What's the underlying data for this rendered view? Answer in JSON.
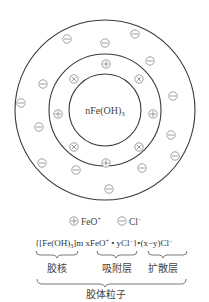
{
  "diagram": {
    "core": {
      "label": "nFe(OH)",
      "subscript": "3"
    },
    "rings": [
      {
        "name": "outer-diffuse-ring",
        "cx": 105,
        "cy": 110,
        "r": 90
      },
      {
        "name": "middle-adsorption-ring",
        "cx": 105,
        "cy": 110,
        "r": 56
      },
      {
        "name": "inner-core-ring",
        "cx": 105,
        "cy": 110,
        "r": 36
      }
    ],
    "ions": [
      {
        "type": "plus",
        "x": 106,
        "y": 64
      },
      {
        "type": "plus",
        "x": 58,
        "y": 114
      },
      {
        "type": "plus",
        "x": 153,
        "y": 114
      },
      {
        "type": "plus",
        "x": 106,
        "y": 163
      },
      {
        "type": "cross",
        "x": 74,
        "y": 79
      },
      {
        "type": "cross",
        "x": 139,
        "y": 79
      },
      {
        "type": "cross",
        "x": 74,
        "y": 147
      },
      {
        "type": "cross",
        "x": 139,
        "y": 147
      },
      {
        "type": "minus",
        "x": 67,
        "y": 39
      },
      {
        "type": "minus",
        "x": 105,
        "y": 43
      },
      {
        "type": "minus",
        "x": 135,
        "y": 34
      },
      {
        "type": "minus",
        "x": 150,
        "y": 61
      },
      {
        "type": "minus",
        "x": 43,
        "y": 84
      },
      {
        "type": "minus",
        "x": 173,
        "y": 96
      },
      {
        "type": "minus",
        "x": 21,
        "y": 103
      },
      {
        "type": "minus",
        "x": 39,
        "y": 127
      },
      {
        "type": "minus",
        "x": 171,
        "y": 135
      },
      {
        "type": "minus",
        "x": 175,
        "y": 156
      },
      {
        "type": "minus",
        "x": 42,
        "y": 163
      },
      {
        "type": "minus",
        "x": 76,
        "y": 170
      },
      {
        "type": "minus",
        "x": 142,
        "y": 168
      },
      {
        "type": "minus",
        "x": 109,
        "y": 189
      }
    ],
    "legend": [
      {
        "symbol": "plus",
        "label": "FeO",
        "superscript": "+"
      },
      {
        "symbol": "minus",
        "label": "Cl",
        "superscript": "−"
      }
    ],
    "formula": {
      "part1": "{[Fe(OH)",
      "part1_sub": "3",
      "part2": "]m xFeO",
      "part2_sup": "+",
      "part3": " • yCl",
      "part3_sup": "−",
      "part4": "}•(x−y)Cl",
      "part4_sup": "−"
    },
    "layer_labels": {
      "core": "胶核",
      "adsorption_layer": "吸附层",
      "diffuse_layer": "扩散层",
      "colloid_particle": "胶体粒子"
    }
  }
}
